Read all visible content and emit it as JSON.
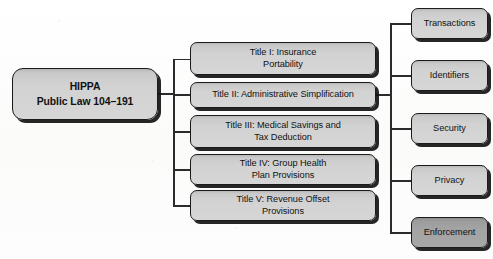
{
  "diagram": {
    "root": {
      "name": "HIPPA",
      "subtitle": "Public Law 104–191",
      "label": "HIPPA\nPublic Law 104–191"
    },
    "titles": [
      {
        "id": "title-1",
        "label": "Title I: Insurance\nPortability"
      },
      {
        "id": "title-2",
        "label": "Title II: Administrative Simplification"
      },
      {
        "id": "title-3",
        "label": "Title III: Medical Savings and\nTax Deduction"
      },
      {
        "id": "title-4",
        "label": "Title IV: Group Health\nPlan Provisions"
      },
      {
        "id": "title-5",
        "label": "Title V: Revenue Offset\nProvisions"
      }
    ],
    "areas": [
      {
        "id": "area-1",
        "label": "Transactions",
        "shade": "light"
      },
      {
        "id": "area-2",
        "label": "Identifiers",
        "shade": "light"
      },
      {
        "id": "area-3",
        "label": "Security",
        "shade": "light"
      },
      {
        "id": "area-4",
        "label": "Privacy",
        "shade": "light"
      },
      {
        "id": "area-5",
        "label": "Enforcement",
        "shade": "dark"
      }
    ],
    "colors": {
      "background": "#fdfdfd",
      "box_fill_light": "#d2d2d2",
      "box_fill_dark": "#a3a3a3",
      "box_border": "#1a1a1a",
      "connector": "#2b2b2b",
      "text": "#111111"
    }
  }
}
